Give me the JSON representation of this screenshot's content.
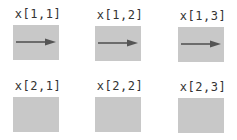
{
  "figure": {
    "background": "#ffffff",
    "panel_color": "#c8c8c8",
    "arrow_color": "#555555",
    "label_color": "#333333",
    "rows": 2,
    "cols": 3,
    "cells": [
      {
        "label": "x[1,1]",
        "row": 1,
        "col": 1,
        "has_arrow": true,
        "arrow_direction": "right"
      },
      {
        "label": "x[1,2]",
        "row": 1,
        "col": 2,
        "has_arrow": true,
        "arrow_direction": "right"
      },
      {
        "label": "x[1,3]",
        "row": 1,
        "col": 3,
        "has_arrow": true,
        "arrow_direction": "right"
      },
      {
        "label": "x[2,1]",
        "row": 2,
        "col": 1,
        "has_arrow": false
      },
      {
        "label": "x[2,2]",
        "row": 2,
        "col": 2,
        "has_arrow": false
      },
      {
        "label": "x[2,3]",
        "row": 2,
        "col": 3,
        "has_arrow": false
      }
    ]
  }
}
